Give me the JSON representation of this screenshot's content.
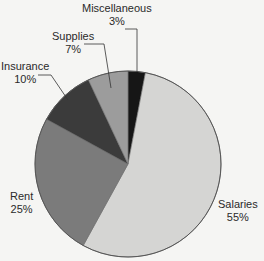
{
  "chart_data": {
    "type": "pie",
    "title": "",
    "start_angle_deg": 0,
    "direction": "clockwise",
    "slices": [
      {
        "label": "Miscellaneous",
        "value": 3,
        "display": "3%",
        "color": "#161616"
      },
      {
        "label": "Salaries",
        "value": 55,
        "display": "55%",
        "color": "#d5d5d3"
      },
      {
        "label": "Rent",
        "value": 25,
        "display": "25%",
        "color": "#7b7b7b"
      },
      {
        "label": "Insurance",
        "value": 10,
        "display": "10%",
        "color": "#3b3b3b"
      },
      {
        "label": "Supplies",
        "value": 7,
        "display": "7%",
        "color": "#9c9c9c"
      }
    ],
    "legend": "none",
    "labels_outside_with_leaders": true
  },
  "labels": {
    "miscellaneous": {
      "name": "Miscellaneous",
      "pct": "3%"
    },
    "supplies": {
      "name": "Supplies",
      "pct": "7%"
    },
    "insurance": {
      "name": "Insurance",
      "pct": "10%"
    },
    "rent": {
      "name": "Rent",
      "pct": "25%"
    },
    "salaries": {
      "name": "Salaries",
      "pct": "55%"
    }
  }
}
